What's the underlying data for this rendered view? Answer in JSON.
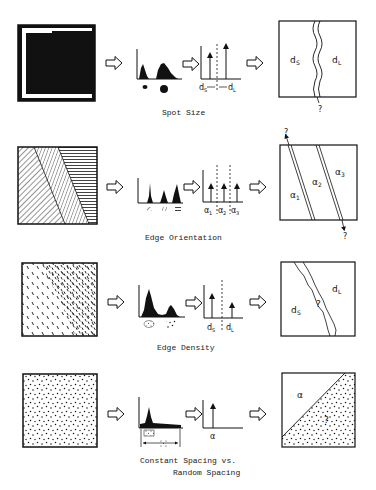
{
  "rows": [
    {
      "id": "spot-size",
      "caption": "Spot Size",
      "histogram_labels": [],
      "spike_labels": [
        "d",
        "S",
        "d",
        "L"
      ],
      "result_labels": {
        "left": "d",
        "left_sub": "S",
        "right": "d",
        "right_sub": "L",
        "unknown": "?"
      }
    },
    {
      "id": "edge-orientation",
      "caption": "Edge Orientation",
      "spike_labels": [
        "α",
        "1",
        "α",
        "2",
        "α",
        "3"
      ],
      "result_labels": {
        "a1": "α",
        "a1_sub": "1",
        "a2": "α",
        "a2_sub": "2",
        "a3": "α",
        "a3_sub": "3",
        "unknown_top": "?",
        "unknown_bottom": "?"
      }
    },
    {
      "id": "edge-density",
      "caption": "Edge Density",
      "spike_labels": [
        "d",
        "S",
        "d",
        "L"
      ],
      "result_labels": {
        "left": "d",
        "left_sub": "S",
        "right": "d",
        "right_sub": "L",
        "unknown": "?"
      }
    },
    {
      "id": "constant-vs-random-spacing",
      "caption_line1": "Constant Spacing vs.",
      "caption_line2": "Random Spacing",
      "spike_labels": [
        "α"
      ],
      "result_labels": {
        "top": "α",
        "unknown": "?"
      }
    }
  ],
  "colors": {
    "ink": "#111111",
    "background": "#ffffff"
  }
}
